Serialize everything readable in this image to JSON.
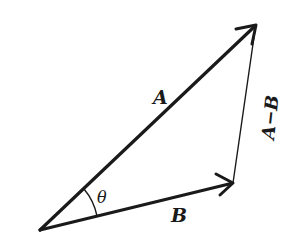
{
  "diagram": {
    "background": "#ffffff",
    "stroke_color": "#1a1a1a",
    "points": {
      "origin": [
        40,
        230
      ],
      "a_tip": [
        256,
        25
      ],
      "b_tip": [
        233,
        183
      ]
    },
    "vectors": [
      {
        "id": "A",
        "label": "A",
        "from": "origin",
        "to": "a_tip",
        "width": 3.2
      },
      {
        "id": "B",
        "label": "B",
        "from": "origin",
        "to": "b_tip",
        "width": 3.2
      },
      {
        "id": "A-B",
        "label": "A−B",
        "from": "b_tip",
        "to": "a_tip",
        "width": 1.4
      }
    ],
    "labels": {
      "a": "A",
      "b": "B",
      "a_minus_b": "A−B",
      "angle": "θ"
    }
  }
}
